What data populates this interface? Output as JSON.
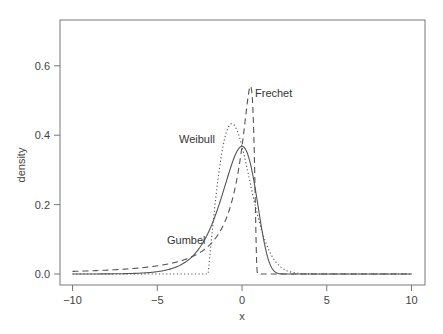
{
  "chart_data": {
    "type": "line",
    "title": "",
    "xlabel": "x",
    "ylabel": "density",
    "xlim": [
      -10.6,
      10.8
    ],
    "ylim": [
      -0.03,
      0.73
    ],
    "x_ticks": [
      -10,
      -5,
      0,
      5,
      10
    ],
    "x_tick_labels": [
      "−10",
      "−5",
      "0",
      "5",
      "10"
    ],
    "y_ticks": [
      0.0,
      0.2,
      0.4,
      0.6
    ],
    "y_tick_labels": [
      "0.0",
      "0.2",
      "0.4",
      "0.6"
    ],
    "grid": false,
    "legend": "none (curves labeled inline)",
    "series": [
      {
        "name": "Gumbel",
        "style": "solid",
        "description": "Gumbel (minimum) density exp(x - e^x); mode at 0 with peak ~0.37",
        "x": [
          -10,
          -8,
          -6,
          -5,
          -4,
          -3,
          -2.5,
          -2,
          -1.5,
          -1,
          -0.5,
          0,
          0.5,
          1,
          1.5,
          2,
          3,
          4,
          6,
          10
        ],
        "values": [
          0.0,
          0.0003,
          0.0025,
          0.0067,
          0.018,
          0.047,
          0.075,
          0.118,
          0.179,
          0.254,
          0.331,
          0.368,
          0.317,
          0.179,
          0.05,
          0.0044,
          0.0,
          0.0,
          0.0,
          0.0
        ]
      },
      {
        "name": "Frechet",
        "style": "dashed",
        "description": "Reversed Frechet (minimum), support x < 1; peak ~0.54 near x=0.5",
        "x": [
          -10,
          -8,
          -6,
          -4,
          -3,
          -2,
          -1.5,
          -1,
          -0.5,
          0,
          0.25,
          0.5,
          0.7,
          0.85,
          0.95,
          1.0,
          10
        ],
        "values": [
          0.0075,
          0.011,
          0.018,
          0.033,
          0.049,
          0.08,
          0.107,
          0.152,
          0.228,
          0.368,
          0.463,
          0.541,
          0.397,
          0.057,
          0.0,
          0.0,
          0.0
        ]
      },
      {
        "name": "Weibull",
        "style": "dotted",
        "description": "Reversed Weibull (minimum) shifted to start at x=-2; peak ~0.43 near x=-0.6",
        "x": [
          -10,
          -2,
          -1.9,
          -1.5,
          -1,
          -0.6,
          0,
          0.5,
          1,
          1.5,
          2,
          3,
          4,
          10
        ],
        "values": [
          0.0,
          0.0,
          0.051,
          0.226,
          0.363,
          0.433,
          0.37,
          0.262,
          0.152,
          0.073,
          0.034,
          0.004,
          0.0,
          0.0
        ]
      }
    ],
    "annotations": [
      {
        "text": "Weibull",
        "x": -2.5,
        "y": 0.39
      },
      {
        "text": "Frechet",
        "x": 1.9,
        "y": 0.52
      },
      {
        "text": "Gumbel",
        "x": -3.3,
        "y": 0.1
      }
    ]
  },
  "labels": {
    "xlabel": "x",
    "ylabel": "density",
    "weibull": "Weibull",
    "frechet": "Frechet",
    "gumbel": "Gumbel"
  },
  "colors": {
    "axis": "#666666",
    "curve": "#555555",
    "text": "#444444"
  }
}
